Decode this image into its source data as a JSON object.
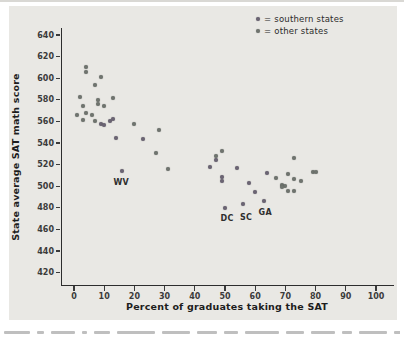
{
  "figure": {
    "kind": "textbook scatterplot figure",
    "labeled_points": [
      "WV",
      "DC",
      "SC",
      "GA"
    ]
  },
  "legend": {
    "prefix": "=",
    "items": [
      {
        "label": "southern states",
        "color": "#6b6473"
      },
      {
        "label": "other states",
        "color": "#6f746e"
      }
    ]
  },
  "chart_data": {
    "type": "scatter",
    "title": "",
    "xlabel": "Percent of graduates taking the SAT",
    "ylabel": "State average SAT math score",
    "xlim": [
      0,
      100
    ],
    "ylim": [
      420,
      640
    ],
    "xticks": [
      0,
      10,
      20,
      30,
      40,
      50,
      60,
      70,
      80,
      90,
      100
    ],
    "yticks": [
      420,
      440,
      460,
      480,
      500,
      520,
      540,
      560,
      580,
      600,
      620,
      640
    ],
    "grid": false,
    "legend_position": "top-right",
    "series": [
      {
        "name": "southern states",
        "color": "#6b6473",
        "points": [
          [
            9,
            558
          ],
          [
            10,
            557
          ],
          [
            12,
            560
          ],
          [
            13,
            562
          ],
          [
            14,
            545
          ],
          [
            23,
            544
          ],
          [
            16,
            514
          ],
          [
            45,
            518
          ],
          [
            47,
            524
          ],
          [
            49,
            509
          ],
          [
            49,
            505
          ],
          [
            54,
            517
          ],
          [
            58,
            503
          ],
          [
            60,
            495
          ],
          [
            64,
            512
          ],
          [
            50,
            480
          ],
          [
            56,
            484
          ],
          [
            63,
            486
          ]
        ]
      },
      {
        "name": "other states",
        "color": "#6f746e",
        "points": [
          [
            4,
            610
          ],
          [
            4,
            606
          ],
          [
            9,
            601
          ],
          [
            7,
            594
          ],
          [
            2,
            583
          ],
          [
            13,
            582
          ],
          [
            8,
            580
          ],
          [
            8,
            576
          ],
          [
            10,
            574
          ],
          [
            3,
            574
          ],
          [
            1,
            566
          ],
          [
            4,
            568
          ],
          [
            6,
            566
          ],
          [
            3,
            561
          ],
          [
            7,
            560
          ],
          [
            20,
            558
          ],
          [
            28,
            552
          ],
          [
            27,
            531
          ],
          [
            31,
            516
          ],
          [
            47,
            528
          ],
          [
            49,
            533
          ],
          [
            67,
            508
          ],
          [
            73,
            526
          ],
          [
            79,
            513
          ],
          [
            80,
            513
          ],
          [
            71,
            511
          ],
          [
            73,
            507
          ],
          [
            75,
            505
          ],
          [
            69,
            501
          ],
          [
            70,
            500
          ],
          [
            69,
            499
          ],
          [
            71,
            496
          ],
          [
            73,
            496
          ]
        ]
      }
    ],
    "annotations": [
      {
        "text": "WV",
        "x": 16,
        "y": 514,
        "dx": -1,
        "dy": 11
      },
      {
        "text": "DC",
        "x": 50,
        "y": 480,
        "dx": 2,
        "dy": 10
      },
      {
        "text": "SC",
        "x": 56,
        "y": 484,
        "dx": 3,
        "dy": 13
      },
      {
        "text": "GA",
        "x": 63,
        "y": 486,
        "dx": 1,
        "dy": 11
      }
    ]
  }
}
